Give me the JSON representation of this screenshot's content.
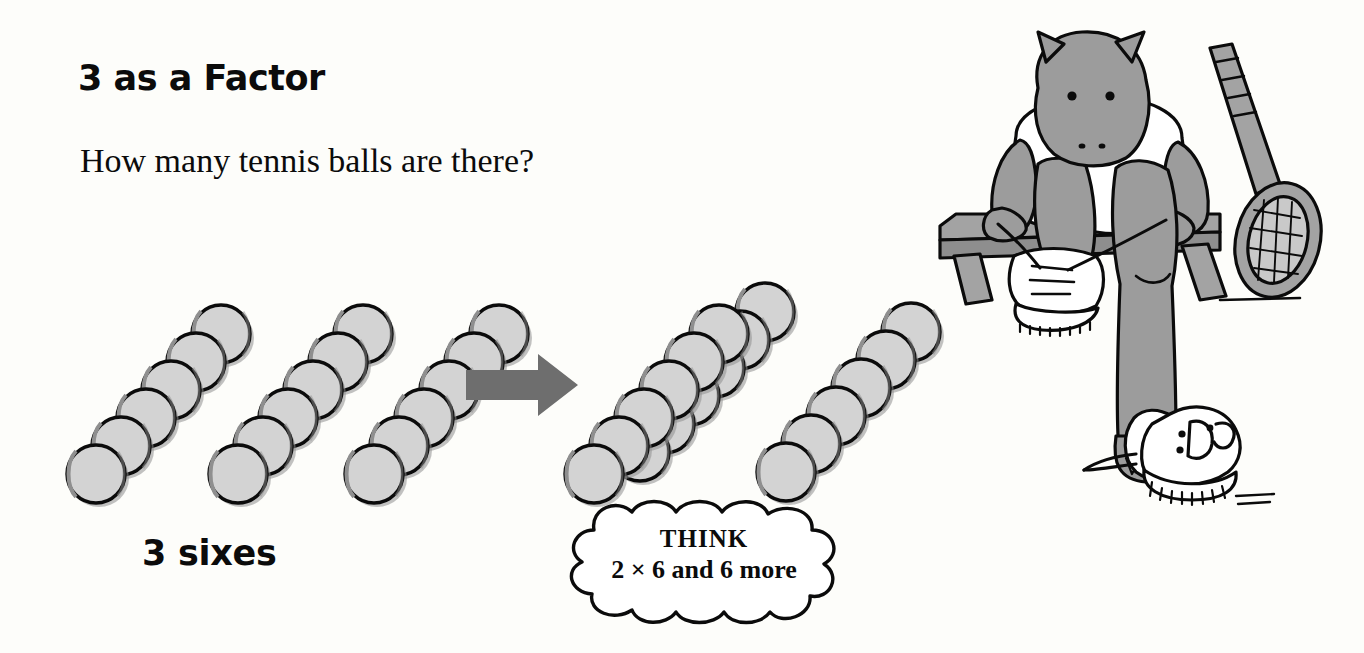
{
  "page": {
    "background_color": "#fdfdfa",
    "title": "3 as a Factor",
    "question": "How many tennis balls are there?",
    "group_label": "3 sixes"
  },
  "colors": {
    "ink": "#0b0b0b",
    "ball_fill": "#d3d3d3",
    "ball_shadow": "#8f8f8f",
    "arrow_fill": "#6e6e6e",
    "hippo_fill": "#9c9c9c",
    "bench_fill": "#a3a3a3",
    "shirt_fill": "#ffffff",
    "shoe_fill": "#ffffff"
  },
  "thought_bubble": {
    "line1": "THINK",
    "line2": "2 × 6 and 6 more"
  },
  "ball_groups": {
    "left": {
      "label": "3 sixes",
      "description": "three diagonal rows of six tennis balls",
      "rows": 3,
      "balls_per_row": 6,
      "total": 18
    },
    "right_pair": {
      "description": "two adjacent diagonal rows of six tennis balls",
      "rows": 2,
      "balls_per_row": 6,
      "total": 12
    },
    "right_single": {
      "description": "one diagonal row of six tennis balls",
      "rows": 1,
      "balls_per_row": 6,
      "total": 6
    }
  },
  "chart_data": {
    "type": "bar",
    "categories": [
      "Group 1",
      "Group 2",
      "Group 3",
      "2 × 6",
      "6 more"
    ],
    "values": [
      6,
      6,
      6,
      12,
      6
    ],
    "xlabel": "",
    "ylabel": "Tennis balls",
    "ylim": [
      0,
      12
    ],
    "annotations": [
      "3 sixes",
      "THINK 2 × 6 and 6 more"
    ]
  },
  "illustration": {
    "scene": "hippo sitting on a bench tying a sneaker",
    "parts": [
      "hippo-character",
      "white-t-shirt",
      "wooden-bench",
      "tennis-racket",
      "laced-sneaker",
      "untied-sneaker"
    ]
  },
  "icons": {
    "arrow": "arrow-right-icon",
    "ball": "tennis-ball-icon",
    "racket": "tennis-racket-icon",
    "shoe": "sneaker-icon"
  }
}
